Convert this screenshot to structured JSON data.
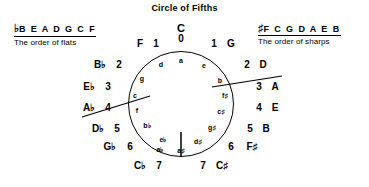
{
  "title": "Circle of Fifths",
  "legends": {
    "flats": {
      "accidental": "♭",
      "sequence": "B E A D G C F",
      "caption": "The order of flats"
    },
    "sharps": {
      "accidental": "♯",
      "sequence": "F C G D A E B",
      "caption": "The order of sharps"
    }
  },
  "circle": {
    "positions": [
      {
        "major": "C",
        "count": "0",
        "minor": "a",
        "clock": 0,
        "layout": "stacked"
      },
      {
        "major": "G",
        "count": "1",
        "minor": "e",
        "clock": 1,
        "layout": "right"
      },
      {
        "major": "D",
        "count": "2",
        "minor": "b",
        "clock": 2,
        "layout": "right"
      },
      {
        "major": "A",
        "count": "3",
        "minor": "f♯",
        "clock": 3,
        "layout": "right"
      },
      {
        "major": "E",
        "count": "4",
        "minor": "c♯",
        "clock": 4,
        "layout": "right"
      },
      {
        "major": "B",
        "count": "5",
        "minor": "g♯",
        "clock": 5,
        "layout": "right"
      },
      {
        "major": "F♯",
        "count": "6",
        "minor": "d♯",
        "clock": 6,
        "layout": "right"
      },
      {
        "major": "C♯",
        "count": "7",
        "minor": "a♯",
        "clock": 7,
        "layout": "right"
      },
      {
        "major": "C♭",
        "count": "7",
        "minor": "a♭",
        "clock": 7,
        "layout": "left"
      },
      {
        "major": "G♭",
        "count": "6",
        "minor": "e♭",
        "clock": 6,
        "layout": "left"
      },
      {
        "major": "D♭",
        "count": "5",
        "minor": "b♭",
        "clock": 5,
        "layout": "left"
      },
      {
        "major": "A♭",
        "count": "4",
        "minor": "f",
        "clock": 4,
        "layout": "left"
      },
      {
        "major": "E♭",
        "count": "3",
        "minor": "c",
        "clock": 3,
        "layout": "left"
      },
      {
        "major": "B♭",
        "count": "2",
        "minor": "g",
        "clock": 2,
        "layout": "left"
      },
      {
        "major": "F",
        "count": "1",
        "minor": "d",
        "clock": 1,
        "layout": "left"
      }
    ],
    "majors": {
      "c": "C",
      "g": "G",
      "d": "D",
      "a": "A",
      "e": "E",
      "b": "B",
      "fsharp": "F♯",
      "csharp": "C♯",
      "cflat": "C♭",
      "gflat": "G♭",
      "dflat": "D♭",
      "aflat": "A♭",
      "eflat": "E♭",
      "bflat": "B♭",
      "f": "F"
    },
    "counts": {
      "c": "0",
      "g": "1",
      "d": "2",
      "a": "3",
      "e": "4",
      "b": "5",
      "fsharp": "6",
      "csharp": "7",
      "cflat": "7",
      "gflat": "6",
      "dflat": "5",
      "aflat": "4",
      "eflat": "3",
      "bflat": "2",
      "f": "1"
    },
    "minors": {
      "a": "a",
      "e": "e",
      "b": "b",
      "fsharp": "f♯",
      "csharp": "c♯",
      "gsharp": "g♯",
      "dsharp": "d♯",
      "asharp": "a♯",
      "aflat": "a♭",
      "eflat": "e♭",
      "bflat": "b♭",
      "f": "f",
      "c": "c",
      "g": "g",
      "d": "d"
    }
  },
  "colors": {
    "stroke": "#000000",
    "background": "#ffffff"
  }
}
